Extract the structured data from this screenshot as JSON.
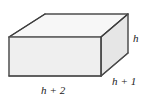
{
  "figure": {
    "name": "rectangular-prism-diagram",
    "shape": "rectangular prism",
    "labels": {
      "height": "h",
      "depth": "h + 1",
      "width": "h + 2"
    },
    "colors": {
      "front_face": "#efefef",
      "top_face": "#f7f7f7",
      "right_face": "#e6e6e6",
      "edge_stroke": "#545454",
      "background": "#ffffff",
      "text": "#1a1a1a"
    },
    "geometry": {
      "front_bottom_left": [
        9,
        76
      ],
      "front_bottom_right": [
        101,
        76
      ],
      "front_top_right": [
        101,
        37
      ],
      "front_top_left": [
        9,
        37
      ],
      "back_top_left": [
        45,
        14
      ],
      "back_top_right": [
        128,
        14
      ],
      "back_bottom_right": [
        128,
        53
      ]
    }
  }
}
